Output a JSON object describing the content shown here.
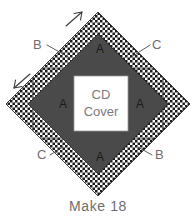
{
  "diagram": {
    "caption": "Make 18",
    "center_label_line1": "CD",
    "center_label_line2": "Cover",
    "colors": {
      "background": "#ffffff",
      "checker_dark": "#1a1a1a",
      "checker_light": "#ffffff",
      "triangle_gray": "#4a4a4a",
      "center_square": "#ffffff",
      "label_text": "#6d6d6d",
      "piece_letter_text": "#1a1a1a",
      "leader_line": "#4a4a4a",
      "arrow": "#3a3a3a",
      "outline": "#2b2b2b"
    },
    "piece_letters": [
      {
        "name": "a-top",
        "label": "A"
      },
      {
        "name": "a-left",
        "label": "A"
      },
      {
        "name": "a-right",
        "label": "A"
      },
      {
        "name": "a-bottom",
        "label": "A"
      }
    ],
    "callouts": [
      {
        "name": "label-b-topleft",
        "label": "B",
        "position": "top-left"
      },
      {
        "name": "label-c-topright",
        "label": "C",
        "position": "top-right"
      },
      {
        "name": "label-c-botleft",
        "label": "C",
        "position": "bottom-left"
      },
      {
        "name": "label-b-botright",
        "label": "B",
        "position": "bottom-right"
      }
    ],
    "arrows": [
      {
        "name": "grain-arrow-northeast",
        "direction": "northeast"
      },
      {
        "name": "grain-arrow-southwest",
        "direction": "southwest"
      }
    ]
  }
}
